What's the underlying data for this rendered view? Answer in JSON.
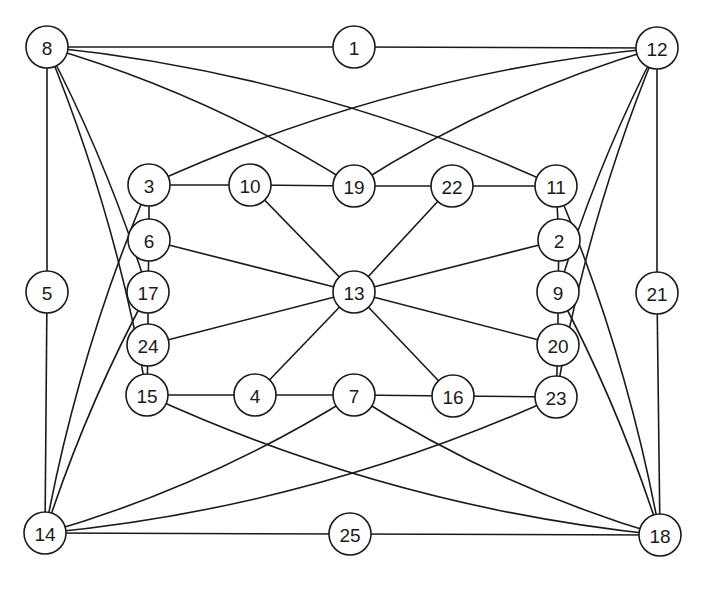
{
  "diagram": {
    "type": "undirected-graph",
    "node_radius": 21,
    "stroke_color": "#1a1a1a",
    "background": "#ffffff",
    "nodes": [
      {
        "id": "1",
        "label": "1",
        "x": 354,
        "y": 47
      },
      {
        "id": "2",
        "label": "2",
        "x": 559,
        "y": 240
      },
      {
        "id": "3",
        "label": "3",
        "x": 149,
        "y": 185
      },
      {
        "id": "4",
        "label": "4",
        "x": 255,
        "y": 395
      },
      {
        "id": "5",
        "label": "5",
        "x": 47,
        "y": 292
      },
      {
        "id": "6",
        "label": "6",
        "x": 149,
        "y": 240
      },
      {
        "id": "7",
        "label": "7",
        "x": 354,
        "y": 395
      },
      {
        "id": "8",
        "label": "8",
        "x": 47,
        "y": 47
      },
      {
        "id": "9",
        "label": "9",
        "x": 558,
        "y": 292
      },
      {
        "id": "10",
        "label": "10",
        "x": 250,
        "y": 185
      },
      {
        "id": "11",
        "label": "11",
        "x": 556,
        "y": 186
      },
      {
        "id": "12",
        "label": "12",
        "x": 657,
        "y": 48
      },
      {
        "id": "13",
        "label": "13",
        "x": 354,
        "y": 292
      },
      {
        "id": "14",
        "label": "14",
        "x": 45,
        "y": 533
      },
      {
        "id": "15",
        "label": "15",
        "x": 147,
        "y": 395
      },
      {
        "id": "16",
        "label": "16",
        "x": 453,
        "y": 396
      },
      {
        "id": "17",
        "label": "17",
        "x": 148,
        "y": 292
      },
      {
        "id": "18",
        "label": "18",
        "x": 660,
        "y": 535
      },
      {
        "id": "19",
        "label": "19",
        "x": 354,
        "y": 186
      },
      {
        "id": "20",
        "label": "20",
        "x": 558,
        "y": 345
      },
      {
        "id": "21",
        "label": "21",
        "x": 657,
        "y": 293
      },
      {
        "id": "22",
        "label": "22",
        "x": 452,
        "y": 186
      },
      {
        "id": "23",
        "label": "23",
        "x": 556,
        "y": 397
      },
      {
        "id": "24",
        "label": "24",
        "x": 148,
        "y": 345
      },
      {
        "id": "25",
        "label": "25",
        "x": 350,
        "y": 534
      }
    ],
    "edges": [
      {
        "from": "8",
        "to": "1",
        "curve": 0
      },
      {
        "from": "1",
        "to": "12",
        "curve": 0
      },
      {
        "from": "8",
        "to": "19",
        "curve": -12
      },
      {
        "from": "8",
        "to": "11",
        "curve": -22
      },
      {
        "from": "12",
        "to": "3",
        "curve": 22
      },
      {
        "from": "12",
        "to": "19",
        "curve": 12
      },
      {
        "from": "8",
        "to": "5",
        "curve": 0
      },
      {
        "from": "8",
        "to": "15",
        "curve": -10
      },
      {
        "from": "8",
        "to": "17",
        "curve": -6
      },
      {
        "from": "5",
        "to": "14",
        "curve": 0
      },
      {
        "from": "14",
        "to": "3",
        "curve": -10
      },
      {
        "from": "14",
        "to": "17",
        "curve": -6
      },
      {
        "from": "12",
        "to": "9",
        "curve": 6
      },
      {
        "from": "12",
        "to": "23",
        "curve": 10
      },
      {
        "from": "12",
        "to": "21",
        "curve": 0
      },
      {
        "from": "21",
        "to": "18",
        "curve": 0
      },
      {
        "from": "18",
        "to": "11",
        "curve": 10
      },
      {
        "from": "18",
        "to": "9",
        "curve": 6
      },
      {
        "from": "14",
        "to": "7",
        "curve": 12
      },
      {
        "from": "14",
        "to": "23",
        "curve": 22
      },
      {
        "from": "14",
        "to": "25",
        "curve": 0
      },
      {
        "from": "25",
        "to": "18",
        "curve": 0
      },
      {
        "from": "18",
        "to": "15",
        "curve": -22
      },
      {
        "from": "18",
        "to": "7",
        "curve": -12
      },
      {
        "from": "3",
        "to": "10",
        "curve": 0
      },
      {
        "from": "10",
        "to": "19",
        "curve": 0
      },
      {
        "from": "19",
        "to": "22",
        "curve": 0
      },
      {
        "from": "22",
        "to": "11",
        "curve": 0
      },
      {
        "from": "3",
        "to": "6",
        "curve": 0
      },
      {
        "from": "6",
        "to": "17",
        "curve": 0
      },
      {
        "from": "17",
        "to": "24",
        "curve": 0
      },
      {
        "from": "24",
        "to": "15",
        "curve": 0
      },
      {
        "from": "11",
        "to": "2",
        "curve": 0
      },
      {
        "from": "2",
        "to": "9",
        "curve": 0
      },
      {
        "from": "9",
        "to": "20",
        "curve": 0
      },
      {
        "from": "20",
        "to": "23",
        "curve": 0
      },
      {
        "from": "15",
        "to": "4",
        "curve": 0
      },
      {
        "from": "4",
        "to": "7",
        "curve": 0
      },
      {
        "from": "7",
        "to": "16",
        "curve": 0
      },
      {
        "from": "16",
        "to": "23",
        "curve": 0
      },
      {
        "from": "13",
        "to": "10",
        "curve": 0
      },
      {
        "from": "13",
        "to": "22",
        "curve": 0
      },
      {
        "from": "13",
        "to": "6",
        "curve": 0
      },
      {
        "from": "13",
        "to": "2",
        "curve": 0
      },
      {
        "from": "13",
        "to": "24",
        "curve": 0
      },
      {
        "from": "13",
        "to": "20",
        "curve": 0
      },
      {
        "from": "13",
        "to": "4",
        "curve": 0
      },
      {
        "from": "13",
        "to": "16",
        "curve": 0
      }
    ]
  },
  "caption": {
    "text": ""
  }
}
